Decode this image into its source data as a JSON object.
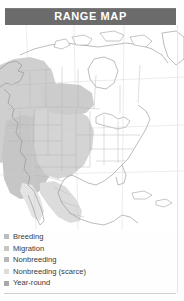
{
  "header": {
    "title": "RANGE MAP",
    "bar_color": "#6b6b6b",
    "text_color": "#ffffff"
  },
  "map": {
    "name": "north-america-range-map",
    "region": "North America",
    "background_color": "#ffffff",
    "outline_color": "#9a9a9a",
    "shading": {
      "breeding": "#c9c9c9",
      "migration": "#d8d8d8",
      "nonbreeding": "#c2c2c2",
      "nonbreeding_scarce": "#e2e2e2",
      "year_round": "#b0b0b0"
    }
  },
  "legend": {
    "items": [
      {
        "label": "Breeding",
        "color": "#bdbdbd"
      },
      {
        "label": "Migration",
        "color": "#c6c6c6"
      },
      {
        "label": "Nonbreeding",
        "color": "#b8b8b8"
      },
      {
        "label": "Nonbreeding (scarce)",
        "color": "#dcdcdc"
      },
      {
        "label": "Year-round",
        "color": "#a8a8a8"
      }
    ]
  },
  "footer": {
    "divider_color": "#d0d0d0"
  }
}
